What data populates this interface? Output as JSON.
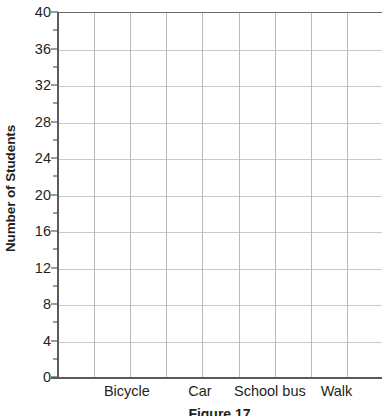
{
  "chart_data": {
    "type": "bar",
    "title": "",
    "subtitle": "",
    "xlabel": "",
    "ylabel": "Number of Students",
    "categories": [
      "Bicycle",
      "Car",
      "School bus",
      "Walk"
    ],
    "values": [
      null,
      null,
      null,
      null
    ],
    "series": [
      {
        "name": "Number of Students",
        "values": [
          null,
          null,
          null,
          null
        ]
      }
    ],
    "ylim": [
      0,
      40
    ],
    "y_major_ticks": [
      0,
      4,
      8,
      12,
      16,
      20,
      24,
      28,
      32,
      36,
      40
    ],
    "y_minor_ticks": [
      2,
      6,
      10,
      14,
      18,
      22,
      26,
      30,
      34,
      38
    ],
    "y_tick_labels": [
      "0",
      "4",
      "8",
      "12",
      "16",
      "20",
      "24",
      "28",
      "32",
      "36",
      "40"
    ],
    "grid": true,
    "grid_columns": 9,
    "legend": false,
    "legend_position": "none",
    "note": "Blank grid template - no bars plotted",
    "colors": {
      "background": "#ffffff",
      "axis": "#5a5a5a",
      "horizontal_grid": "#c9c9c9",
      "vertical_grid": "#b9b9b9",
      "text": "#231f20"
    }
  },
  "axes": {
    "y_title": "Number of Students",
    "x_categories": [
      {
        "label": "Bicycle",
        "center_pct": 21.5
      },
      {
        "label": "Car",
        "center_pct": 44.0
      },
      {
        "label": "School bus",
        "center_pct": 65.5
      },
      {
        "label": "Walk",
        "center_pct": 86.0
      }
    ]
  },
  "caption": {
    "text": "Figure 17"
  }
}
